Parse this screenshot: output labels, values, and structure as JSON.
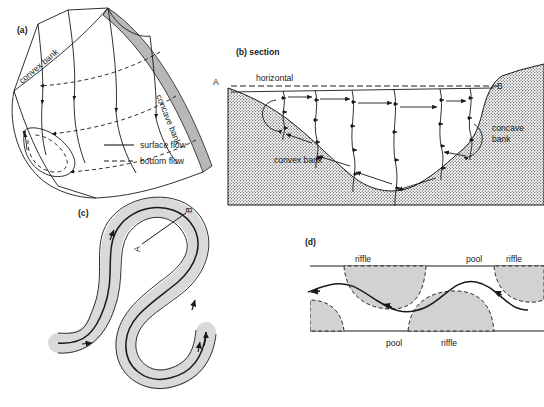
{
  "figure": {
    "background": "#ffffff",
    "ink": "#1a1a1a",
    "channel_fill": "#d9d9d9",
    "bar_fill": "#d2d2d2",
    "bank_hatch": "#5a5a5a"
  },
  "panels": {
    "a": {
      "label": "(a)",
      "convex_bank": "convex bank",
      "concave_bank": "concave bank",
      "legend": [
        {
          "style": "solid",
          "label": "surface flow"
        },
        {
          "style": "dashed",
          "label": "bottom flow"
        }
      ]
    },
    "b": {
      "label": "(b) section",
      "horizontal": "horizontal",
      "point_a": "A",
      "point_b": "B",
      "convex_bank": "convex bank",
      "concave_bank_line1": "concave",
      "concave_bank_line2": "bank"
    },
    "c": {
      "label": "(c)",
      "point_a": "A",
      "point_b": "B"
    },
    "d": {
      "label": "(d)",
      "top_labels": [
        "riffle",
        "pool",
        "riffle"
      ],
      "bottom_labels": [
        "pool",
        "riffle"
      ]
    }
  }
}
